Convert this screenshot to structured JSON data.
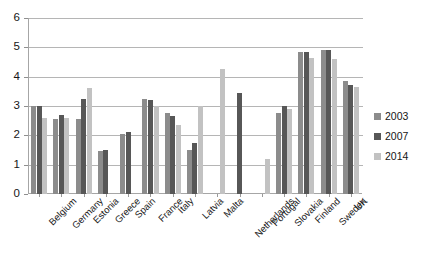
{
  "chart_data": {
    "type": "bar",
    "title": "",
    "subtitle": "",
    "xlabel": "",
    "ylabel": "",
    "ylim": [
      0,
      6
    ],
    "yticks": [
      0,
      1,
      2,
      3,
      4,
      5,
      6
    ],
    "ytick_labels": [
      "0",
      "1",
      "2",
      "3",
      "4",
      "5",
      "6"
    ],
    "grid": true,
    "legend_position": "right",
    "categories": [
      "Belgium",
      "Germany",
      "Estonia",
      "Greece",
      "Spain",
      "France",
      "Italy",
      "Latvia",
      "Malta",
      "Netherlands",
      "Portugal",
      "Slovakia",
      "Finland",
      "Sweden",
      "UK"
    ],
    "series": [
      {
        "name": "2003",
        "color": "#8c8c8c",
        "values": [
          3.0,
          2.55,
          2.55,
          1.45,
          2.05,
          3.25,
          2.75,
          1.5,
          null,
          null,
          null,
          2.75,
          4.85,
          4.9,
          3.85
        ]
      },
      {
        "name": "2007",
        "color": "#575757",
        "values": [
          3.0,
          2.7,
          3.25,
          1.5,
          2.1,
          3.2,
          2.65,
          1.75,
          null,
          3.45,
          null,
          3.0,
          4.85,
          4.9,
          3.7
        ]
      },
      {
        "name": "2014",
        "color": "#c2c2c2",
        "values": [
          2.6,
          2.6,
          3.6,
          null,
          null,
          3.0,
          2.35,
          3.0,
          4.25,
          null,
          1.2,
          2.9,
          4.65,
          4.6,
          3.65
        ]
      }
    ]
  },
  "legend": {
    "entries": [
      {
        "label": "2003",
        "color": "#8c8c8c"
      },
      {
        "label": "2007",
        "color": "#575757"
      },
      {
        "label": "2014",
        "color": "#c2c2c2"
      }
    ]
  }
}
